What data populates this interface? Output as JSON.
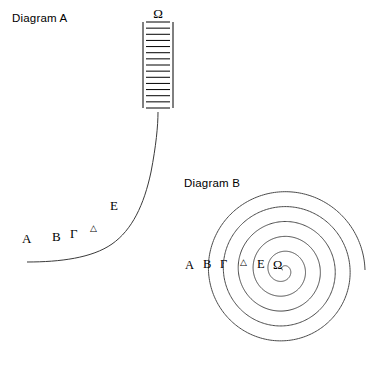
{
  "figure": {
    "width": 376,
    "height": 366,
    "background": "#ffffff",
    "ink_color": "#000000"
  },
  "diagram_a": {
    "title": "Diagram A",
    "title_x": 12,
    "title_y": 22,
    "description": "An exponential-style curve rising from lower left into a vertical ladder at the top",
    "ladder": {
      "x_left": 143,
      "x_right": 173,
      "y_top": 22,
      "y_bottom": 108,
      "rung_count": 14,
      "top_cap_label": "Ω",
      "top_cap_label_x": 158,
      "top_cap_label_y": 18
    },
    "curve": {
      "start_x": 27,
      "start_y": 262,
      "end_x": 158,
      "end_y": 112,
      "color": "#3a3a3a"
    },
    "labels": [
      {
        "text": "A",
        "x": 22,
        "y": 243,
        "size": "normal"
      },
      {
        "text": "B",
        "x": 52,
        "y": 241,
        "size": "normal"
      },
      {
        "text": "Γ",
        "x": 70,
        "y": 238,
        "size": "normal"
      },
      {
        "text": "△",
        "x": 90,
        "y": 231,
        "size": "small"
      },
      {
        "text": "E",
        "x": 110,
        "y": 210,
        "size": "normal"
      },
      {
        "text": "Ω",
        "x": 158,
        "y": 18,
        "size": "normal"
      }
    ]
  },
  "diagram_b": {
    "title": "Diagram B",
    "title_x": 184,
    "title_y": 187,
    "description": "An Archimedean spiral with about five and a half turns, labelled along its horizontal radius",
    "spiral": {
      "center_x": 283,
      "center_y": 270,
      "max_radius": 82,
      "turns": 5.5,
      "color": "#4a4a4a"
    },
    "labels": [
      {
        "text": "A",
        "x": 185,
        "y": 269,
        "size": "normal"
      },
      {
        "text": "B",
        "x": 203,
        "y": 268,
        "size": "normal"
      },
      {
        "text": "Γ",
        "x": 220,
        "y": 268,
        "size": "normal"
      },
      {
        "text": "△",
        "x": 240,
        "y": 265,
        "size": "small"
      },
      {
        "text": "E",
        "x": 257,
        "y": 268,
        "size": "normal"
      },
      {
        "text": "Ω",
        "x": 273,
        "y": 269,
        "size": "normal"
      }
    ]
  },
  "legend_sequence": [
    "A",
    "B",
    "Γ",
    "△",
    "E",
    "Ω"
  ]
}
